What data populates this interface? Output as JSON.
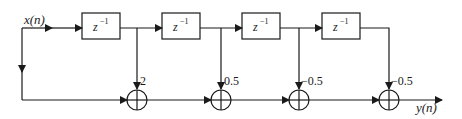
{
  "diagram": {
    "type": "FIR filter direct-form block diagram",
    "input_label": "x(n)",
    "output_label": "y(n)",
    "delay_label": "z",
    "delay_exponent": "−1",
    "delays": [
      {
        "label": "z^-1"
      },
      {
        "label": "z^-1"
      },
      {
        "label": "z^-1"
      },
      {
        "label": "z^-1"
      }
    ],
    "taps": [
      {
        "coefficient": "2"
      },
      {
        "coefficient": "0.5"
      },
      {
        "coefficient": "−0.5"
      },
      {
        "coefficient": "−0.5"
      }
    ],
    "adders": 4,
    "colors": {
      "line": "#1a1a1a",
      "background": "#ffffff"
    }
  }
}
